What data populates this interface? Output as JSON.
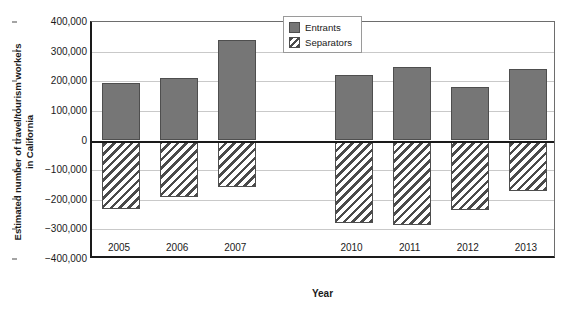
{
  "chart_data": {
    "type": "bar",
    "title": "",
    "xlabel": "Year",
    "ylabel": "Estimated number of travel/tourism workers\nin California",
    "categories": [
      "2005",
      "2006",
      "2007",
      "",
      "2010",
      "2011",
      "2012",
      "2013"
    ],
    "ylim": [
      -400000,
      400000
    ],
    "ytick_labels": [
      "400,000",
      "300,000",
      "200,000",
      "100,000",
      "0",
      "−100,000",
      "−200,000",
      "−300,000",
      "−400,000"
    ],
    "ytick_values": [
      400000,
      300000,
      200000,
      100000,
      0,
      -100000,
      -200000,
      -300000,
      -400000
    ],
    "grid": true,
    "legend_position": "top-center",
    "series": [
      {
        "name": "Entrants",
        "fill": "#767676",
        "pattern": "solid",
        "values": [
          195000,
          212000,
          340000,
          null,
          222000,
          248000,
          180000,
          240000
        ]
      },
      {
        "name": "Separators",
        "fill": "#ffffff",
        "pattern": "diagonal-hatch",
        "values": [
          -232000,
          -190000,
          -157000,
          null,
          -280000,
          -285000,
          -233000,
          -172000
        ]
      }
    ]
  },
  "legend": {
    "items": [
      {
        "label": "Entrants",
        "swatch": "solid-gray-swatch"
      },
      {
        "label": "Separators",
        "swatch": "hatched-swatch"
      }
    ]
  },
  "axes": {
    "x_title": "Year",
    "y_title": "Estimated number of travel/tourism workers\nin California"
  }
}
